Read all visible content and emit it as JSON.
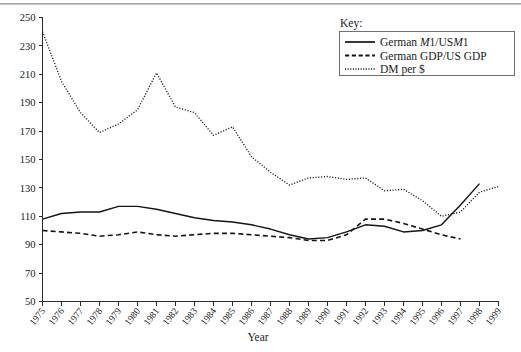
{
  "figure": {
    "top_rule": "decorative-rule"
  },
  "chart_data": {
    "type": "line",
    "title": "",
    "xlabel": "Year",
    "ylabel": "",
    "grid": false,
    "legend_position": "top-right",
    "legend_title": "Key:",
    "xlim": [
      1975,
      1999
    ],
    "ylim": [
      50,
      250
    ],
    "ytick_step": 20,
    "yticks": [
      50,
      70,
      90,
      110,
      130,
      150,
      170,
      190,
      210,
      230,
      250
    ],
    "categories": [
      1975,
      1976,
      1977,
      1978,
      1979,
      1980,
      1981,
      1982,
      1983,
      1984,
      1985,
      1986,
      1987,
      1988,
      1989,
      1990,
      1991,
      1992,
      1993,
      1994,
      1995,
      1996,
      1997,
      1998,
      1999
    ],
    "xtick_labels": [
      "1975",
      "1976",
      "1977",
      "1978",
      "1979",
      "1980",
      "1981",
      "1982",
      "1983",
      "1984",
      "1985",
      "1986",
      "1987",
      "1988",
      "1989",
      "1990",
      "1991",
      "1992",
      "1993",
      "1994",
      "1995",
      "1996",
      "1997",
      "1998",
      "1999"
    ],
    "series": [
      {
        "name": "German M1/US M1",
        "label_plain": "German M1/USM1",
        "label_parts": [
          "German ",
          "M",
          "1/US",
          "M",
          "1"
        ],
        "style": "solid",
        "color": "#151515",
        "x": [
          1975,
          1976,
          1977,
          1978,
          1979,
          1980,
          1981,
          1982,
          1983,
          1984,
          1985,
          1986,
          1987,
          1988,
          1989,
          1990,
          1991,
          1992,
          1993,
          1994,
          1995,
          1996,
          1997,
          1998
        ],
        "values": [
          108,
          112,
          113,
          113,
          117,
          117,
          115,
          112,
          109,
          107,
          106,
          104,
          101,
          97,
          94,
          95,
          99,
          104,
          103,
          99,
          100,
          104,
          118,
          133
        ]
      },
      {
        "name": "German GDP/US GDP",
        "label_plain": "German GDP/US GDP",
        "label_parts": [
          "German GDP/US GDP"
        ],
        "style": "dashed",
        "color": "#151515",
        "x": [
          1975,
          1976,
          1977,
          1978,
          1979,
          1980,
          1981,
          1982,
          1983,
          1984,
          1985,
          1986,
          1987,
          1988,
          1989,
          1990,
          1991,
          1992,
          1993,
          1994,
          1995,
          1996,
          1997
        ],
        "values": [
          100,
          99,
          98,
          96,
          97,
          99,
          97,
          96,
          97,
          98,
          98,
          97,
          96,
          95,
          93,
          93,
          97,
          108,
          108,
          105,
          101,
          97,
          94
        ]
      },
      {
        "name": "DM per $",
        "label_plain": "DM per $",
        "label_parts": [
          "DM per $"
        ],
        "style": "dotted",
        "color": "#151515",
        "x": [
          1975,
          1976,
          1977,
          1978,
          1979,
          1980,
          1981,
          1982,
          1983,
          1984,
          1985,
          1986,
          1987,
          1988,
          1989,
          1990,
          1991,
          1992,
          1993,
          1994,
          1995,
          1996,
          1997,
          1998,
          1999
        ],
        "values": [
          240,
          205,
          183,
          169,
          175,
          185,
          211,
          187,
          183,
          167,
          173,
          152,
          141,
          132,
          137,
          138,
          136,
          137,
          128,
          129,
          121,
          110,
          113,
          127,
          131
        ]
      }
    ]
  },
  "axes": {
    "x_title": "Year"
  },
  "legend": {
    "title": "Key:",
    "entries": [
      {
        "label": "German M1/USM1",
        "style": "solid"
      },
      {
        "label": "German GDP/US GDP",
        "style": "dashed"
      },
      {
        "label": "DM per $",
        "style": "dotted"
      }
    ]
  }
}
